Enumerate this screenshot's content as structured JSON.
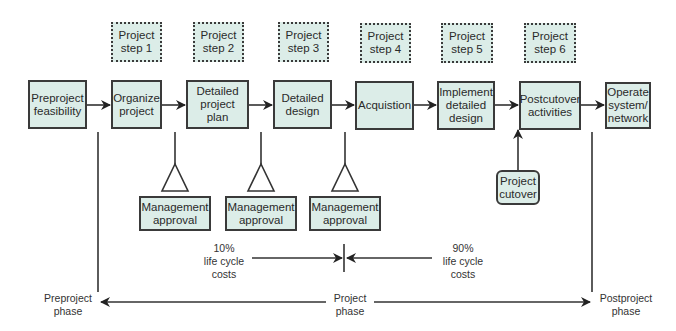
{
  "diagram": {
    "project_steps": [
      {
        "label": "Project\nstep 1"
      },
      {
        "label": "Project\nstep 2"
      },
      {
        "label": "Project\nstep 3"
      },
      {
        "label": "Project\nstep 4"
      },
      {
        "label": "Project\nstep 5"
      },
      {
        "label": "Project\nstep 6"
      }
    ],
    "flow_boxes": [
      {
        "label": "Preproject\nfeasibility"
      },
      {
        "label": "Organize\nproject"
      },
      {
        "label": "Detailed\nproject plan"
      },
      {
        "label": "Detailed\ndesign"
      },
      {
        "label": "Acquistion"
      },
      {
        "label": "Implement\ndetailed\ndesign"
      },
      {
        "label": "Postcutover\nactivities"
      },
      {
        "label": "Operate\nsystem/\nnetwork"
      }
    ],
    "approvals": [
      {
        "label": "Management\napproval"
      },
      {
        "label": "Management\napproval"
      },
      {
        "label": "Management\napproval"
      }
    ],
    "cutover": {
      "label": "Project\ncutover"
    },
    "costs": {
      "left": "10%\nlife cycle\ncosts",
      "right": "90%\nlife cycle\ncosts"
    },
    "phases": {
      "pre": "Preproject\nphase",
      "project": "Project\nphase",
      "post": "Postproject\nphase"
    },
    "colors": {
      "box_fill": "#dcede8",
      "stroke": "#3a3a3a"
    }
  }
}
